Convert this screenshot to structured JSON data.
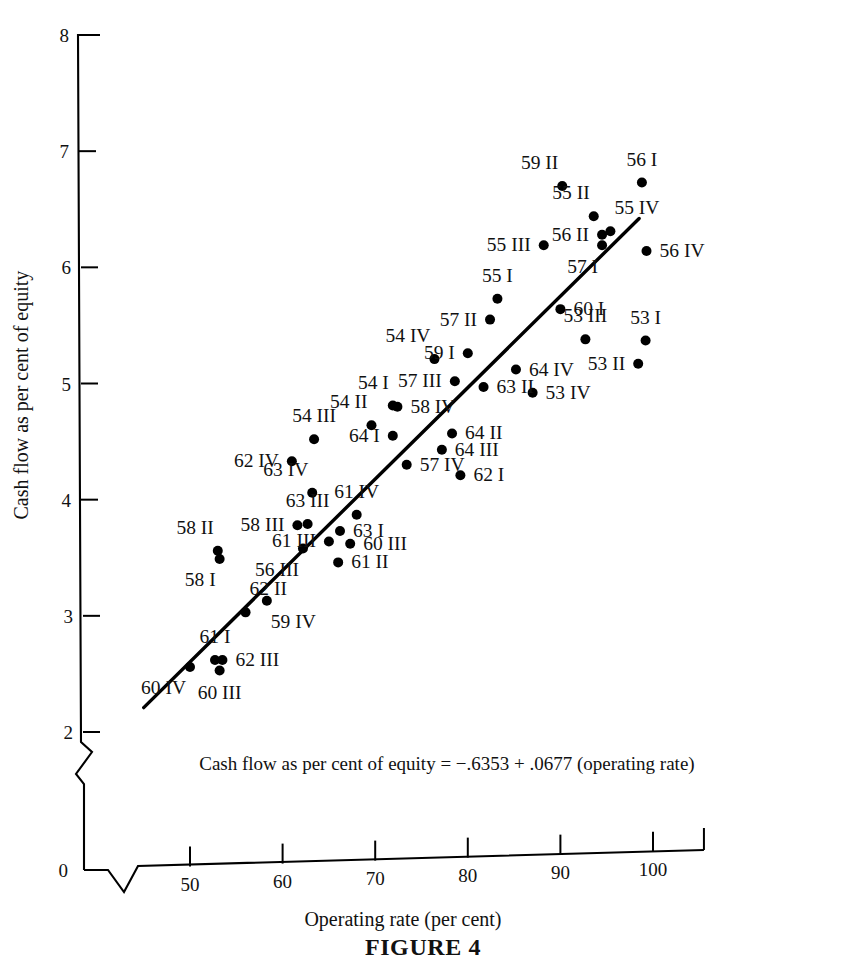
{
  "figure": {
    "caption": "FIGURE 4",
    "equation": "Cash flow as per cent of equity = −.6353 + .0677 (operating rate)"
  },
  "chart_data": {
    "type": "scatter",
    "title": "FIGURE 4",
    "xlabel": "Operating rate (per cent)",
    "ylabel": "Cash flow as per cent of equity",
    "xlim": [
      44,
      106
    ],
    "ylim": [
      2,
      8
    ],
    "y_axis_break": true,
    "x_axis_break": true,
    "grid": false,
    "legend": null,
    "xticks": [
      50,
      60,
      70,
      80,
      90,
      100
    ],
    "yticks": [
      0,
      2,
      3,
      4,
      5,
      6,
      7,
      8
    ],
    "annotation": "Cash flow as per cent of equity = −.6353 + .0677 (operating rate)",
    "regression": {
      "intercept": -0.6353,
      "slope": 0.0677,
      "x_start": 45.0,
      "y_start": 2.21,
      "x_end": 98.5,
      "y_end": 6.42
    },
    "points": [
      {
        "label": "59 II",
        "x": 90.2,
        "y": 6.7,
        "label_pos": "above-left"
      },
      {
        "label": "56 I",
        "x": 98.8,
        "y": 6.73,
        "label_pos": "above"
      },
      {
        "label": "55 II",
        "x": 93.6,
        "y": 6.44,
        "label_pos": "above-left"
      },
      {
        "label": "55 IV",
        "x": 95.4,
        "y": 6.31,
        "label_pos": "above-right"
      },
      {
        "label": "56 II",
        "x": 94.5,
        "y": 6.28,
        "label_pos": "left"
      },
      {
        "label": "57 I",
        "x": 94.5,
        "y": 6.19,
        "label_pos": "below-left"
      },
      {
        "label": "55 III",
        "x": 88.2,
        "y": 6.19,
        "label_pos": "left"
      },
      {
        "label": "56 IV",
        "x": 99.3,
        "y": 6.14,
        "label_pos": "right"
      },
      {
        "label": "55 I",
        "x": 83.2,
        "y": 5.73,
        "label_pos": "above"
      },
      {
        "label": "57 II",
        "x": 82.4,
        "y": 5.55,
        "label_pos": "left"
      },
      {
        "label": "60 I",
        "x": 90.0,
        "y": 5.64,
        "label_pos": "right"
      },
      {
        "label": "53 III",
        "x": 92.7,
        "y": 5.38,
        "label_pos": "above"
      },
      {
        "label": "53 I",
        "x": 99.2,
        "y": 5.37,
        "label_pos": "above"
      },
      {
        "label": "53 II",
        "x": 98.4,
        "y": 5.17,
        "label_pos": "left"
      },
      {
        "label": "54 IV",
        "x": 76.4,
        "y": 5.21,
        "label_pos": "above-left"
      },
      {
        "label": "59 I",
        "x": 80.0,
        "y": 5.26,
        "label_pos": "left"
      },
      {
        "label": "64 IV",
        "x": 85.2,
        "y": 5.12,
        "label_pos": "right"
      },
      {
        "label": "57 III",
        "x": 78.6,
        "y": 5.02,
        "label_pos": "left"
      },
      {
        "label": "63 II",
        "x": 81.7,
        "y": 4.97,
        "label_pos": "right"
      },
      {
        "label": "53 IV",
        "x": 87.0,
        "y": 4.92,
        "label_pos": "right"
      },
      {
        "label": "54 I",
        "x": 71.9,
        "y": 4.81,
        "label_pos": "above-left"
      },
      {
        "label": "58 IV",
        "x": 72.4,
        "y": 4.8,
        "label_pos": "right"
      },
      {
        "label": "54 II",
        "x": 69.6,
        "y": 4.64,
        "label_pos": "above-left"
      },
      {
        "label": "54 III",
        "x": 63.4,
        "y": 4.52,
        "label_pos": "above"
      },
      {
        "label": "64 I",
        "x": 71.9,
        "y": 4.55,
        "label_pos": "left"
      },
      {
        "label": "64 II",
        "x": 78.3,
        "y": 4.57,
        "label_pos": "right"
      },
      {
        "label": "64 III",
        "x": 77.2,
        "y": 4.43,
        "label_pos": "right"
      },
      {
        "label": "62 IV",
        "x": 61.0,
        "y": 4.33,
        "label_pos": "left"
      },
      {
        "label": "57 IV",
        "x": 73.4,
        "y": 4.3,
        "label_pos": "right"
      },
      {
        "label": "62 I",
        "x": 79.2,
        "y": 4.21,
        "label_pos": "right"
      },
      {
        "label": "63 IV",
        "x": 63.2,
        "y": 4.06,
        "label_pos": "above-left"
      },
      {
        "label": "61 IV",
        "x": 68.0,
        "y": 3.87,
        "label_pos": "above"
      },
      {
        "label": "58 III",
        "x": 61.6,
        "y": 3.78,
        "label_pos": "left"
      },
      {
        "label": "63 III",
        "x": 62.7,
        "y": 3.79,
        "label_pos": "above"
      },
      {
        "label": "63 I",
        "x": 66.2,
        "y": 3.73,
        "label_pos": "right"
      },
      {
        "label": "61 III",
        "x": 65.0,
        "y": 3.64,
        "label_pos": "left"
      },
      {
        "label": "60 III",
        "x": 67.3,
        "y": 3.62,
        "label_pos": "right"
      },
      {
        "label": "58 II",
        "x": 53.0,
        "y": 3.56,
        "label_pos": "above-left"
      },
      {
        "label": "58 I",
        "x": 53.2,
        "y": 3.49,
        "label_pos": "below-left"
      },
      {
        "label": "56 III",
        "x": 62.2,
        "y": 3.58,
        "label_pos": "below-left"
      },
      {
        "label": "61 II",
        "x": 66.0,
        "y": 3.46,
        "label_pos": "right"
      },
      {
        "label": "62 II",
        "x": 56.0,
        "y": 3.03,
        "label_pos": "above-right"
      },
      {
        "label": "59 IV",
        "x": 58.3,
        "y": 3.13,
        "label_pos": "below-right"
      },
      {
        "label": "61 I",
        "x": 52.7,
        "y": 2.62,
        "label_pos": "above"
      },
      {
        "label": "62 III",
        "x": 53.5,
        "y": 2.62,
        "label_pos": "right"
      },
      {
        "label": "60 III b",
        "x": 53.2,
        "y": 2.53,
        "label_pos": "below",
        "display_label": "60 III"
      },
      {
        "label": "60 IV",
        "x": 50.0,
        "y": 2.56,
        "label_pos": "below-left"
      }
    ]
  },
  "axes": {
    "x_tick_labels": [
      "50",
      "60",
      "70",
      "80",
      "90",
      "100"
    ],
    "y_tick_labels": [
      "0",
      "2",
      "3",
      "4",
      "5",
      "6",
      "7",
      "8"
    ],
    "x_title": "Operating rate (per cent)",
    "y_title": "Cash flow as per cent of equity"
  }
}
